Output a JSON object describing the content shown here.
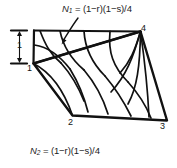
{
  "figure": {
    "kind": "bilinear-quadrilateral-shape-function-contours",
    "stroke_color": "#111111",
    "background": "#ffffff"
  },
  "labels": {
    "equation_top": {
      "symbol": "N",
      "subscript": "1",
      "expression": "= (1−r)(1−s)/4",
      "full_text": "N1 = (1−r)(1−s)/4"
    },
    "equation_bottom": {
      "symbol": "N",
      "subscript": "2",
      "expression": "= (1−r)(1−s)/4",
      "full_text": "N2 = (1−r)(1−s)/4"
    },
    "dimension": {
      "value": "1"
    },
    "nodes": [
      {
        "id": "1",
        "text": "1"
      },
      {
        "id": "2",
        "text": "2"
      },
      {
        "id": "3",
        "text": "3"
      },
      {
        "id": "4",
        "text": "4"
      }
    ]
  }
}
